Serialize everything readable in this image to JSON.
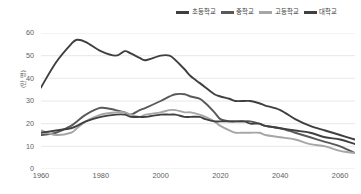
{
  "legend": {
    "position": "top-right",
    "entries": [
      {
        "label": "초등학교",
        "color": "#3f3f3f"
      },
      {
        "label": "중학교",
        "color": "#595959"
      },
      {
        "label": "고등학교",
        "color": "#a6a6a6"
      },
      {
        "label": "대학교",
        "color": "#404040"
      }
    ]
  },
  "yaxis": {
    "title": "(만 명)",
    "ticks": [
      "60",
      "50",
      "40",
      "30",
      "20",
      "10",
      "0"
    ],
    "min": 0,
    "max": 60
  },
  "xaxis": {
    "ticks": [
      "1960",
      "1980",
      "2000",
      "2020",
      "2040",
      "2060"
    ],
    "min": 1960,
    "max": 2065
  },
  "chart_data": {
    "type": "line",
    "title": "",
    "xlabel": "",
    "ylabel": "(만 명)",
    "xlim": [
      1960,
      2065
    ],
    "ylim": [
      0,
      60
    ],
    "grid": "horizontal",
    "legend_position": "top-right",
    "x": [
      1960,
      1965,
      1970,
      1972,
      1975,
      1980,
      1985,
      1988,
      1990,
      1993,
      1995,
      2000,
      2003,
      2005,
      2008,
      2010,
      2013,
      2015,
      2018,
      2020,
      2023,
      2025,
      2028,
      2030,
      2033,
      2035,
      2040,
      2045,
      2050,
      2055,
      2060,
      2065
    ],
    "series": [
      {
        "name": "초등학교",
        "color": "#3f3f3f",
        "values": [
          36,
          47,
          55,
          57,
          56,
          52,
          50,
          52,
          51,
          49,
          48,
          50,
          50,
          48,
          44,
          41,
          38,
          36,
          33,
          32,
          31,
          30,
          30,
          30,
          29,
          28,
          26,
          22,
          19,
          17,
          15,
          13
        ]
      },
      {
        "name": "중학교",
        "color": "#595959",
        "values": [
          15,
          16,
          19,
          21,
          24,
          27,
          26,
          25,
          24,
          26,
          27,
          30,
          32,
          33,
          33,
          32,
          31,
          29,
          25,
          22,
          21,
          21,
          21,
          21,
          20,
          19,
          18,
          16,
          14,
          12,
          10,
          7
        ]
      },
      {
        "name": "고등학교",
        "color": "#a6a6a6",
        "values": [
          17,
          15,
          16,
          18,
          21,
          24,
          25,
          25,
          24,
          23,
          24,
          25,
          26,
          26,
          25,
          25,
          24,
          23,
          21,
          19,
          17,
          16,
          16,
          16,
          16,
          15,
          14,
          13,
          11,
          10,
          8,
          7
        ]
      },
      {
        "name": "대학교",
        "color": "#404040",
        "values": [
          16,
          17,
          18,
          19,
          21,
          23,
          24,
          24,
          23,
          23,
          23,
          24,
          24,
          24,
          23,
          23,
          23,
          22,
          21,
          21,
          21,
          21,
          21,
          20,
          20,
          19,
          18,
          17,
          16,
          14,
          13,
          11
        ]
      }
    ]
  }
}
